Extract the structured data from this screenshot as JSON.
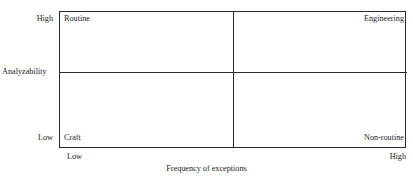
{
  "figure": {
    "type": "two-by-two-matrix",
    "background_color": "#ffffff",
    "line_color": "#2a2a2a",
    "text_color": "#1d1d1d"
  },
  "axes": {
    "y": {
      "title": "Analyzability",
      "high_label": "High",
      "low_label": "Low"
    },
    "x": {
      "title": "Frequency of exceptions",
      "low_label": "Low",
      "high_label": "High"
    }
  },
  "quadrants": {
    "top_left": "Routine",
    "top_right": "Engineering",
    "bottom_left": "Craft",
    "bottom_right": "Non-routine"
  },
  "chart_data": {
    "type": "table",
    "title": "",
    "xlabel": "Frequency of exceptions",
    "ylabel": "Analyzability",
    "x_ticks": [
      "Low",
      "High"
    ],
    "y_ticks": [
      "Low",
      "High"
    ],
    "grid": true,
    "legend": "none",
    "cells": [
      {
        "x": "Low",
        "y": "High",
        "label": "Routine",
        "align": "left"
      },
      {
        "x": "High",
        "y": "High",
        "label": "Engineering",
        "align": "right"
      },
      {
        "x": "Low",
        "y": "Low",
        "label": "Craft",
        "align": "left"
      },
      {
        "x": "High",
        "y": "Low",
        "label": "Non-routine",
        "align": "right"
      }
    ]
  }
}
